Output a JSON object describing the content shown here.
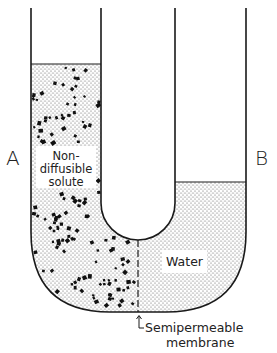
{
  "diagram": {
    "side_labels": {
      "left": "A",
      "right": "B"
    },
    "left_compartment": {
      "label_lines": [
        "Non-",
        "diffusible",
        "solute"
      ],
      "contents": "solution with non-diffusible solute particles"
    },
    "right_compartment": {
      "label": "Water",
      "contents": "water"
    },
    "membrane": {
      "label_lines": [
        "Semipermeable",
        "membrane"
      ],
      "arrow": "up-arrow"
    },
    "colors": {
      "outline": "#1a1a1a",
      "stipple": "#555555",
      "particle": "#111111",
      "background": "#ffffff"
    }
  }
}
